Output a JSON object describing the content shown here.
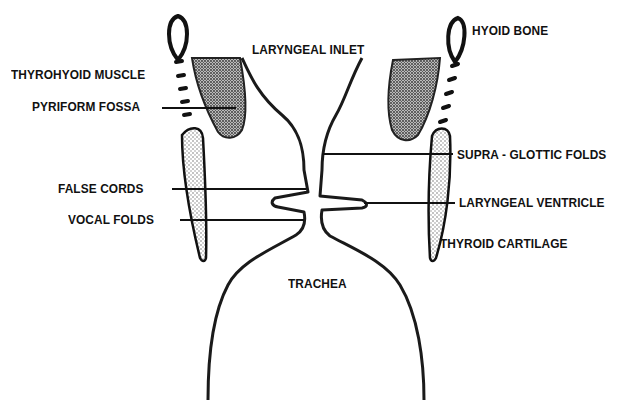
{
  "diagram": {
    "labels": {
      "laryngeal_inlet": "LARYNGEAL INLET",
      "hyoid_bone": "HYOID BONE",
      "thyrohyoid_muscle": "THYROHYOID MUSCLE",
      "pyriform_fossa": "PYRIFORM FOSSA",
      "supra_glottic_folds": "SUPRA - GLOTTIC FOLDS",
      "false_cords": "FALSE CORDS",
      "laryngeal_ventricle": "LARYNGEAL VENTRICLE",
      "vocal_folds": "VOCAL FOLDS",
      "thyroid_cartilage": "THYROID CARTILAGE",
      "trachea": "TRACHEA"
    },
    "colors": {
      "ink": "#111111",
      "stipple_light": "#cfcfcf",
      "stipple_dark": "#6a6a6a",
      "background": "#ffffff"
    }
  }
}
